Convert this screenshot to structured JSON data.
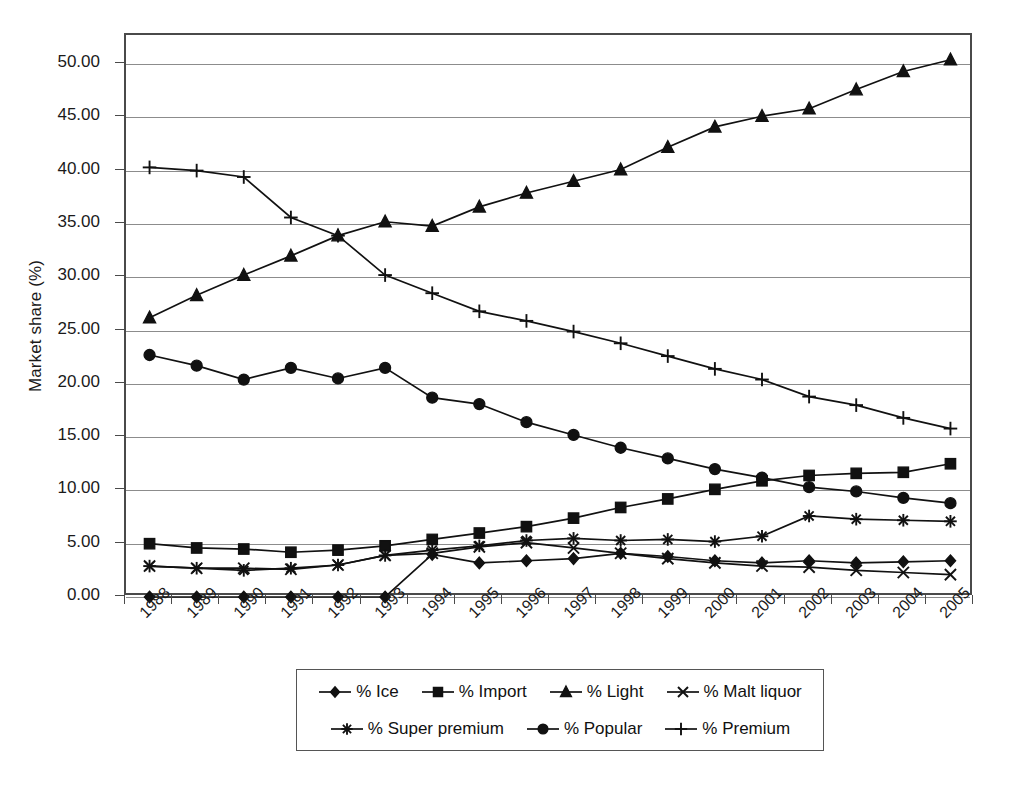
{
  "chart_data": {
    "type": "line",
    "title": "",
    "xlabel": "",
    "ylabel": "Market share (%)",
    "x": [
      1988,
      1989,
      1990,
      1991,
      1992,
      1993,
      1994,
      1995,
      1996,
      1997,
      1998,
      1999,
      2000,
      2001,
      2002,
      2003,
      2004,
      2005
    ],
    "categories": [
      "1988",
      "1989",
      "1990",
      "1991",
      "1992",
      "1993",
      "1994",
      "1995",
      "1996",
      "1997",
      "1998",
      "1999",
      "2000",
      "2001",
      "2002",
      "2003",
      "2004",
      "2005"
    ],
    "ylim": [
      0,
      52.6
    ],
    "yticks": [
      0,
      5,
      10,
      15,
      20,
      25,
      30,
      35,
      40,
      45,
      50
    ],
    "ytick_labels": [
      "0.00",
      "5.00",
      "10.00",
      "15.00",
      "20.00",
      "25.00",
      "30.00",
      "35.00",
      "40.00",
      "45.00",
      "50.00"
    ],
    "grid": true,
    "legend_position": "bottom",
    "series": [
      {
        "name": "% Ice",
        "marker": "diamond",
        "values": [
          0.0,
          0.0,
          0.0,
          0.0,
          0.0,
          0.0,
          4.0,
          3.2,
          3.4,
          3.6,
          4.1,
          3.8,
          3.4,
          3.2,
          3.4,
          3.2,
          3.3,
          3.4
        ]
      },
      {
        "name": "% Import",
        "marker": "square",
        "values": [
          5.0,
          4.6,
          4.5,
          4.2,
          4.4,
          4.8,
          5.4,
          6.0,
          6.6,
          7.4,
          8.4,
          9.2,
          10.1,
          10.9,
          11.4,
          11.6,
          11.7,
          12.5
        ]
      },
      {
        "name": "% Light",
        "marker": "triangle",
        "values": [
          26.2,
          28.3,
          30.2,
          32.0,
          33.9,
          35.2,
          34.8,
          36.6,
          37.9,
          39.0,
          40.1,
          42.2,
          44.1,
          45.1,
          45.8,
          47.6,
          49.3,
          50.4
        ]
      },
      {
        "name": "% Malt liquor",
        "marker": "x",
        "values": [
          2.9,
          2.7,
          2.7,
          2.6,
          3.0,
          3.9,
          4.1,
          4.7,
          5.1,
          4.6,
          4.1,
          3.6,
          3.2,
          2.9,
          2.8,
          2.5,
          2.3,
          2.1
        ]
      },
      {
        "name": "% Super premium",
        "marker": "asterisk",
        "values": [
          2.9,
          2.7,
          2.5,
          2.7,
          3.0,
          3.9,
          4.4,
          4.8,
          5.3,
          5.5,
          5.3,
          5.4,
          5.2,
          5.7,
          7.6,
          7.3,
          7.2,
          7.1
        ]
      },
      {
        "name": "% Popular",
        "marker": "circle",
        "values": [
          22.7,
          21.7,
          20.4,
          21.5,
          20.5,
          21.5,
          18.7,
          18.1,
          16.4,
          15.2,
          14.0,
          13.0,
          12.0,
          11.2,
          10.3,
          9.9,
          9.3,
          8.8
        ]
      },
      {
        "name": "% Premium",
        "marker": "plus",
        "values": [
          40.3,
          40.0,
          39.4,
          35.6,
          33.9,
          30.2,
          28.5,
          26.8,
          25.9,
          24.9,
          23.8,
          22.6,
          21.4,
          20.4,
          18.8,
          18.0,
          16.8,
          15.8
        ]
      }
    ]
  }
}
